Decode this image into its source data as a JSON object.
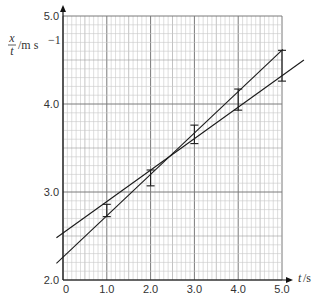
{
  "chart_data": {
    "type": "scatter",
    "title": "",
    "xlabel": "t/s",
    "ylabel": "x/t / m s^-1",
    "ylabel_parts": {
      "num": "x",
      "den": "t",
      "unit": "/m s",
      "exp": "−1"
    },
    "xlabel_parts": {
      "var": "t",
      "unit": "/s"
    },
    "xlim": [
      0,
      5.0
    ],
    "ylim": [
      2.0,
      5.0
    ],
    "x_ticks": [
      "0",
      "1.0",
      "2.0",
      "3.0",
      "4.0",
      "5.0"
    ],
    "y_ticks": [
      "2.0",
      "3.0",
      "4.0",
      "5.0"
    ],
    "grid": {
      "on": true,
      "minor_step_x": 0.1,
      "minor_step_y": 0.1,
      "major_step": 1.0
    },
    "error_bars": [
      {
        "x": 1.0,
        "y_low": 2.72,
        "y_high": 2.86
      },
      {
        "x": 2.0,
        "y_low": 3.07,
        "y_high": 3.25
      },
      {
        "x": 3.0,
        "y_low": 3.55,
        "y_high": 3.76
      },
      {
        "x": 4.0,
        "y_low": 3.93,
        "y_high": 4.17
      },
      {
        "x": 5.0,
        "y_low": 4.26,
        "y_high": 4.61
      }
    ],
    "series": [
      {
        "name": "steepest line",
        "x": [
          -0.15,
          5.02
        ],
        "y": [
          2.19,
          4.62
        ]
      },
      {
        "name": "shallowest line",
        "x": [
          -0.15,
          5.5
        ],
        "y": [
          2.48,
          4.5
        ]
      }
    ],
    "colors": {
      "grid_minor": "#c8c8c8",
      "grid_major": "#7a7a7a",
      "line": "#1a1a1a",
      "axis": "#111111"
    }
  }
}
